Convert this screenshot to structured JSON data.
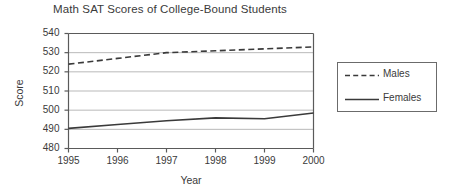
{
  "chart_data": {
    "type": "line",
    "title": "Math SAT Scores of College-Bound Students",
    "xlabel": "Year",
    "ylabel": "Score",
    "x": [
      1995,
      1996,
      1997,
      1998,
      1999,
      2000
    ],
    "xlim": [
      1995,
      2000
    ],
    "ylim": [
      480,
      540
    ],
    "ytick_labels": [
      "540",
      "530",
      "520",
      "510",
      "500",
      "490",
      "480"
    ],
    "ytick_values": [
      540,
      530,
      520,
      510,
      500,
      490,
      480
    ],
    "xtick_labels": [
      "1995",
      "1996",
      "1997",
      "1998",
      "1999",
      "2000"
    ],
    "grid": "horizontal",
    "legend_position": "right-outside",
    "series": [
      {
        "name": "Males",
        "style": "dashed",
        "color": "#3a3a3a",
        "values": [
          524,
          527,
          530,
          531,
          532,
          533
        ]
      },
      {
        "name": "Females",
        "style": "solid",
        "color": "#3a3a3a",
        "values": [
          490.5,
          492.5,
          494.5,
          496,
          495.5,
          498.5
        ]
      }
    ]
  },
  "legend": {
    "entries": [
      {
        "label": "Males",
        "style": "dashed"
      },
      {
        "label": "Females",
        "style": "solid"
      }
    ]
  },
  "axes": {
    "y_title": "Score",
    "x_title": "Year"
  }
}
